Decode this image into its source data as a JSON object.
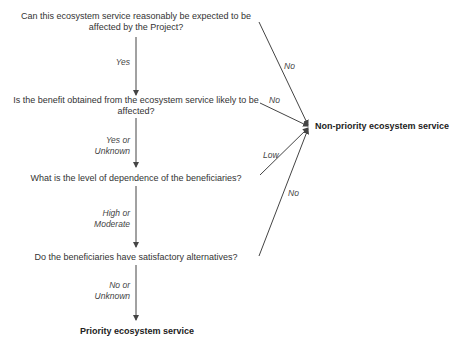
{
  "questions": [
    {
      "line1": "Can this ecosystem service reasonably be expected to be",
      "line2": "affected by the Project?"
    },
    {
      "line1": "Is the benefit obtained from the ecosystem service likely to be",
      "line2": "affected?"
    },
    {
      "line1": "What is the level of dependence of the beneficiaries?"
    },
    {
      "line1": "Do the beneficiaries have satisfactory alternatives?"
    }
  ],
  "down_labels": [
    {
      "line1": "Yes"
    },
    {
      "line1": "Yes or",
      "line2": "Unknown"
    },
    {
      "line1": "High or",
      "line2": "Moderate"
    },
    {
      "line1": "No or",
      "line2": "Unknown"
    }
  ],
  "side_labels": [
    "No",
    "No",
    "Low",
    "No"
  ],
  "outcomes": {
    "non_priority": "Non-priority ecosystem service",
    "priority": "Priority ecosystem service"
  },
  "colors": {
    "line": "#444444",
    "text": "#333333"
  }
}
